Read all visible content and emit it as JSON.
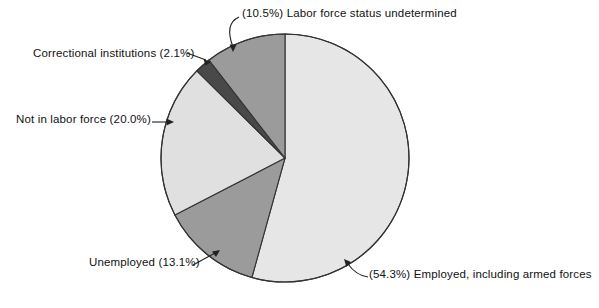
{
  "chart_data": {
    "type": "pie",
    "title": "",
    "subtitle": "",
    "xlabel": "",
    "ylabel": "",
    "legend_position": "none",
    "grid": false,
    "start_angle_deg": 0,
    "direction": "clockwise",
    "total_percent": 100.0,
    "categories": [
      "Employed, including armed forces",
      "Unemployed",
      "Not in labor force",
      "Correctional institutions",
      "Labor force status undetermined"
    ],
    "values": [
      54.3,
      13.1,
      20.0,
      2.1,
      10.5
    ],
    "slices": [
      {
        "name": "Employed, including armed forces",
        "value": 54.3,
        "label": "(54.3%) Employed, including armed forces",
        "percent_text": "54.3%",
        "color": "#e6e6e6"
      },
      {
        "name": "Unemployed",
        "value": 13.1,
        "label": "Unemployed (13.1%)",
        "percent_text": "13.1%",
        "color": "#9b9b9b"
      },
      {
        "name": "Not in labor force",
        "value": 20.0,
        "label": "Not in labor force (20.0%)",
        "percent_text": "20.0%",
        "color": "#e0e0e0"
      },
      {
        "name": "Correctional institutions",
        "value": 2.1,
        "label": "Correctional institutions (2.1%)",
        "percent_text": "2.1%",
        "color": "#494949"
      },
      {
        "name": "Labor force status undetermined",
        "value": 10.5,
        "label": "(10.5%) Labor force status undetermined",
        "percent_text": "10.5%",
        "color": "#9b9b9b"
      }
    ]
  },
  "labels": {
    "undetermined": "(10.5%) Labor force status undetermined",
    "correctional": "Correctional institutions (2.1%)",
    "not_in_labor_force": "Not in labor force (20.0%)",
    "unemployed": "Unemployed (13.1%)",
    "employed": "(54.3%) Employed, including armed forces"
  },
  "geometry": {
    "center_x": 285,
    "center_y": 158,
    "radius": 124
  },
  "colors": {
    "background": "#ffffff",
    "outline": "#333333",
    "text": "#111111",
    "leader_line": "#222222",
    "light_gray": "#e6e6e6",
    "medium_gray": "#9b9b9b",
    "dark_gray": "#494949"
  }
}
